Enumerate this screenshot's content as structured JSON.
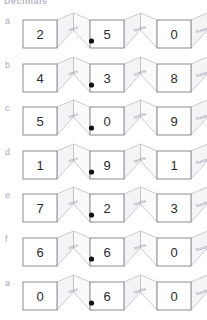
{
  "document": {
    "title": "Decimals",
    "type": "place-value-fold-strips-worksheet"
  },
  "place_value_labels": {
    "ones": "ones",
    "tenths": "tenths",
    "hundredths": "hundredths"
  },
  "decimal_point": ".",
  "rows": [
    {
      "label": "a",
      "digits": [
        "2",
        "5",
        "0"
      ],
      "value": "2.50"
    },
    {
      "label": "b",
      "digits": [
        "4",
        "3",
        "8"
      ],
      "value": "4.38"
    },
    {
      "label": "c",
      "digits": [
        "5",
        "0",
        "9"
      ],
      "value": "5.09"
    },
    {
      "label": "d",
      "digits": [
        "1",
        "9",
        "1"
      ],
      "value": "1.91"
    },
    {
      "label": "e",
      "digits": [
        "7",
        "2",
        "3"
      ],
      "value": "7.23"
    },
    {
      "label": "f",
      "digits": [
        "6",
        "6",
        "0"
      ],
      "value": "6.60"
    },
    {
      "label": "a",
      "digits": [
        "0",
        "6",
        "0"
      ],
      "value": "0.60"
    }
  ],
  "colors": {
    "page_background": "#ffffff",
    "cell_border": "#6f6f76",
    "fold_fill": "#f4f4f6",
    "fold_border": "#b6b6be",
    "digit_text": "#2b2b2b",
    "label_text": "#a9a9b4",
    "fold_label_text": "#8d8d96",
    "decimal_dot": "#111111"
  }
}
